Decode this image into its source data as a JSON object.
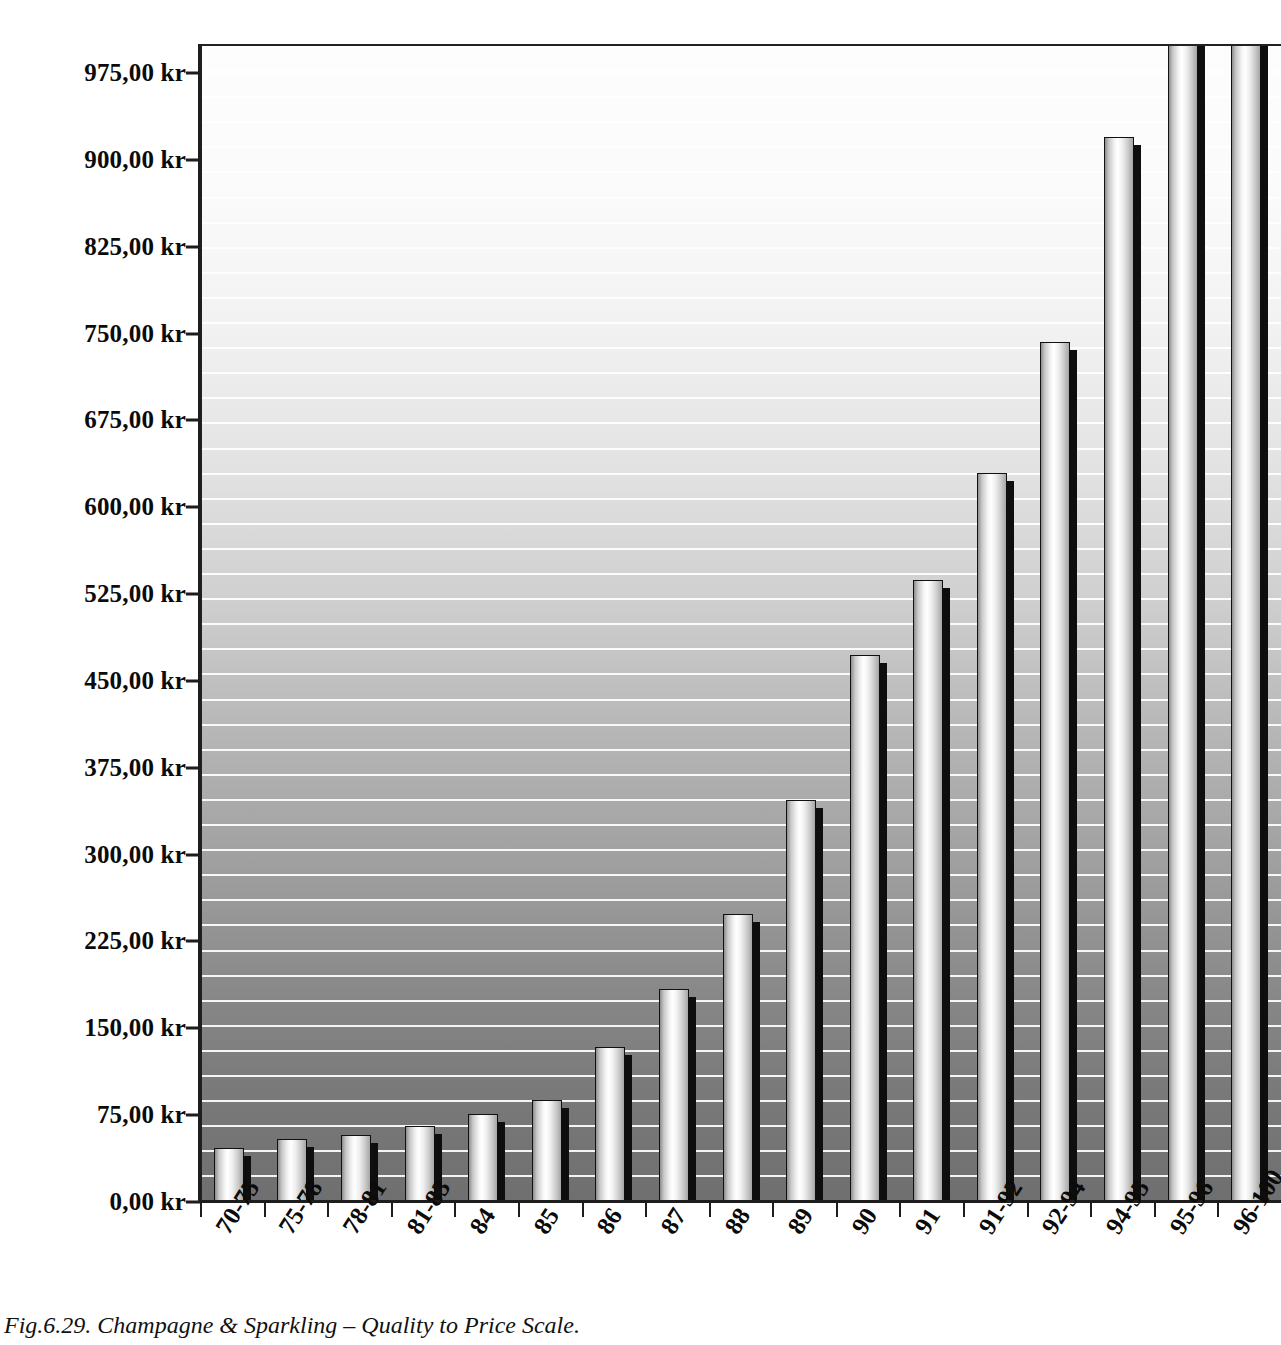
{
  "figure": {
    "caption": "Fig.6.29. Champagne & Sparkling – Quality to Price Scale.",
    "currency_suffix": "kr"
  },
  "chart_data": {
    "type": "bar",
    "title": "Champagne & Sparkling – Quality to Price Scale",
    "xlabel": "",
    "ylabel": "",
    "ylim": [
      0,
      1000
    ],
    "grid": true,
    "legend": "none",
    "categories": [
      "70-75",
      "75-78",
      "78-81",
      "81-83",
      "84",
      "85",
      "86",
      "87",
      "88",
      "89",
      "90",
      "91",
      "91-92",
      "92-94",
      "94-95",
      "95-96",
      "96-100"
    ],
    "values": [
      47,
      54,
      58,
      66,
      76,
      88,
      134,
      184,
      249,
      347,
      472,
      537,
      630,
      743,
      920,
      1050,
      1080
    ],
    "value_notes": "Bars for 95-96 and 96-100 are cut off by the top edge of the figure; their values exceed the 975,00 kr axis maximum.",
    "ytick_labels": [
      "975,00 kr",
      "900,00 kr",
      "825,00 kr",
      "750,00 kr",
      "675,00 kr",
      "600,00 kr",
      "525,00 kr",
      "450,00 kr",
      "375,00 kr",
      "300,00 kr",
      "225,00 kr",
      "150,00 kr",
      "75,00 kr",
      "0,00 kr"
    ],
    "ytick_values": [
      975,
      900,
      825,
      750,
      675,
      600,
      525,
      450,
      375,
      300,
      225,
      150,
      75,
      0
    ],
    "colors": {
      "bar_light": "#ffffff",
      "bar_dark": "#8e8e8e",
      "bar_outline": "#111111",
      "bar_shadow": "#0e0e0e",
      "axis": "#1d1d1d",
      "plot_bg_top": "#fdfdfd",
      "plot_bg_bottom": "#6f6f6f",
      "gridline": "#ffffff",
      "text": "#0b0b0b"
    }
  }
}
